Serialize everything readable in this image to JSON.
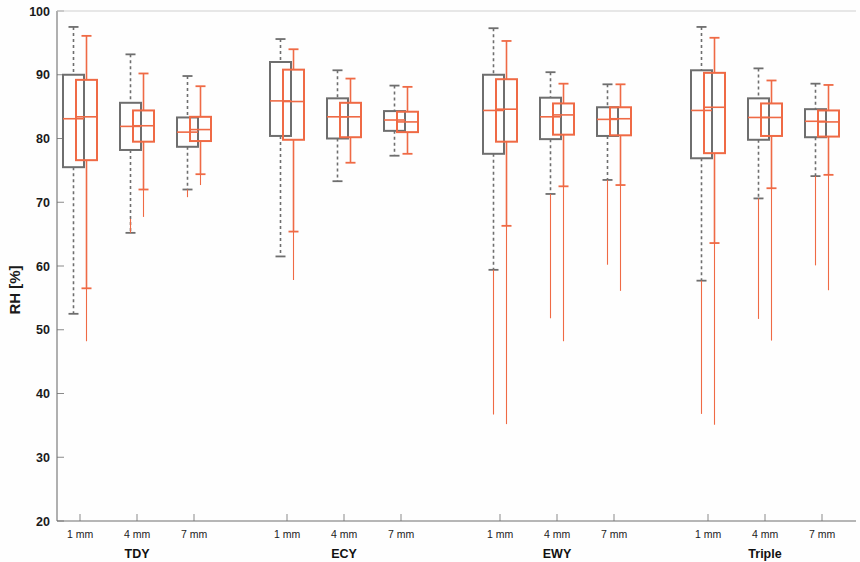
{
  "chart_data": {
    "type": "box",
    "title": "",
    "xlabel": "",
    "ylabel": "RH [%]",
    "ylim": [
      20,
      100
    ],
    "yticks": [
      20,
      30,
      40,
      50,
      60,
      70,
      80,
      90,
      100
    ],
    "ytick_labels": [
      "20",
      "30",
      "40",
      "50",
      "60",
      "70",
      "80",
      "90",
      "100"
    ],
    "grid": false,
    "legend": "none",
    "colors": {
      "series_a": "#6e6e6e",
      "series_b": "#ef6a45",
      "axis": "#6f6f6f",
      "text": "#1a1a1a"
    },
    "groups": [
      "TDY",
      "ECY",
      "EWY",
      "Triple"
    ],
    "subcategories": [
      "1 mm",
      "4 mm",
      "7 mm"
    ],
    "series": [
      {
        "name": "series_a",
        "color": "#6e6e6e",
        "style": "dashed-whisker"
      },
      {
        "name": "series_b",
        "color": "#ef6a45",
        "style": "solid-whisker"
      }
    ],
    "boxes": [
      {
        "group": "TDY",
        "sub": "1 mm",
        "series": "series_a",
        "whisker_high": 97.5,
        "q3": 90.0,
        "median": 83.1,
        "q1": 75.5,
        "whisker_low": 52.5
      },
      {
        "group": "TDY",
        "sub": "1 mm",
        "series": "series_b",
        "whisker_high": 96.1,
        "q3": 89.2,
        "median": 83.4,
        "q1": 76.6,
        "whisker_low": 56.5,
        "tail_low": 48.2
      },
      {
        "group": "TDY",
        "sub": "4 mm",
        "series": "series_a",
        "whisker_high": 93.2,
        "q3": 85.6,
        "median": 81.9,
        "q1": 78.2,
        "whisker_low": 65.2,
        "tail_low": 67.4
      },
      {
        "group": "TDY",
        "sub": "4 mm",
        "series": "series_b",
        "whisker_high": 90.2,
        "q3": 84.4,
        "median": 82.0,
        "q1": 79.5,
        "whisker_low": 72.0,
        "tail_low": 67.7
      },
      {
        "group": "TDY",
        "sub": "7 mm",
        "series": "series_a",
        "whisker_high": 89.8,
        "q3": 83.3,
        "median": 81.0,
        "q1": 78.7,
        "whisker_low": 72.0,
        "tail_low": 70.8
      },
      {
        "group": "TDY",
        "sub": "7 mm",
        "series": "series_b",
        "whisker_high": 88.2,
        "q3": 83.4,
        "median": 81.4,
        "q1": 79.6,
        "whisker_low": 74.4,
        "tail_low": 72.7
      },
      {
        "group": "ECY",
        "sub": "1 mm",
        "series": "series_a",
        "whisker_high": 95.6,
        "q3": 92.0,
        "median": 85.9,
        "q1": 80.4,
        "whisker_low": 61.5
      },
      {
        "group": "ECY",
        "sub": "1 mm",
        "series": "series_b",
        "whisker_high": 94.0,
        "q3": 90.8,
        "median": 85.8,
        "q1": 79.8,
        "whisker_low": 65.4,
        "tail_low": 57.8
      },
      {
        "group": "ECY",
        "sub": "4 mm",
        "series": "series_a",
        "whisker_high": 90.7,
        "q3": 86.3,
        "median": 83.4,
        "q1": 80.0,
        "whisker_low": 73.3
      },
      {
        "group": "ECY",
        "sub": "4 mm",
        "series": "series_b",
        "whisker_high": 89.4,
        "q3": 85.6,
        "median": 83.4,
        "q1": 80.2,
        "whisker_low": 76.2
      },
      {
        "group": "ECY",
        "sub": "7 mm",
        "series": "series_a",
        "whisker_high": 88.3,
        "q3": 84.3,
        "median": 82.9,
        "q1": 81.2,
        "whisker_low": 77.3
      },
      {
        "group": "ECY",
        "sub": "7 mm",
        "series": "series_b",
        "whisker_high": 88.1,
        "q3": 84.2,
        "median": 82.6,
        "q1": 81.0,
        "whisker_low": 77.6
      },
      {
        "group": "EWY",
        "sub": "1 mm",
        "series": "series_a",
        "whisker_high": 97.3,
        "q3": 90.0,
        "median": 84.4,
        "q1": 77.6,
        "whisker_low": 59.4,
        "tail_low": 36.7
      },
      {
        "group": "EWY",
        "sub": "1 mm",
        "series": "series_b",
        "whisker_high": 95.3,
        "q3": 89.3,
        "median": 84.6,
        "q1": 79.5,
        "whisker_low": 66.3,
        "tail_low": 35.2
      },
      {
        "group": "EWY",
        "sub": "4 mm",
        "series": "series_a",
        "whisker_high": 90.4,
        "q3": 86.4,
        "median": 83.4,
        "q1": 79.9,
        "whisker_low": 71.3,
        "tail_low": 51.8
      },
      {
        "group": "EWY",
        "sub": "4 mm",
        "series": "series_b",
        "whisker_high": 88.6,
        "q3": 85.5,
        "median": 83.7,
        "q1": 80.6,
        "whisker_low": 72.5,
        "tail_low": 48.2
      },
      {
        "group": "EWY",
        "sub": "7 mm",
        "series": "series_a",
        "whisker_high": 88.5,
        "q3": 84.9,
        "median": 83.0,
        "q1": 80.4,
        "whisker_low": 73.5,
        "tail_low": 60.2
      },
      {
        "group": "EWY",
        "sub": "7 mm",
        "series": "series_b",
        "whisker_high": 88.5,
        "q3": 84.9,
        "median": 83.1,
        "q1": 80.5,
        "whisker_low": 72.7,
        "tail_low": 56.1
      },
      {
        "group": "Triple",
        "sub": "1 mm",
        "series": "series_a",
        "whisker_high": 97.5,
        "q3": 90.7,
        "median": 84.4,
        "q1": 76.9,
        "whisker_low": 57.7,
        "tail_low": 36.8
      },
      {
        "group": "Triple",
        "sub": "1 mm",
        "series": "series_b",
        "whisker_high": 95.8,
        "q3": 90.3,
        "median": 84.9,
        "q1": 77.7,
        "whisker_low": 63.6,
        "tail_low": 35.1
      },
      {
        "group": "Triple",
        "sub": "4 mm",
        "series": "series_a",
        "whisker_high": 91.0,
        "q3": 86.3,
        "median": 83.3,
        "q1": 79.8,
        "whisker_low": 70.6,
        "tail_low": 51.7
      },
      {
        "group": "Triple",
        "sub": "4 mm",
        "series": "series_b",
        "whisker_high": 89.1,
        "q3": 85.5,
        "median": 83.3,
        "q1": 80.4,
        "whisker_low": 72.2,
        "tail_low": 48.3
      },
      {
        "group": "Triple",
        "sub": "7 mm",
        "series": "series_a",
        "whisker_high": 88.6,
        "q3": 84.6,
        "median": 82.7,
        "q1": 80.2,
        "whisker_low": 74.1,
        "tail_low": 60.1
      },
      {
        "group": "Triple",
        "sub": "7 mm",
        "series": "series_b",
        "whisker_high": 88.4,
        "q3": 84.4,
        "median": 82.6,
        "q1": 80.3,
        "whisker_low": 74.3,
        "tail_low": 56.2
      }
    ]
  },
  "axes": {
    "y_title": "RH [%]",
    "y_tick_labels": [
      "100",
      "90",
      "80",
      "70",
      "60",
      "50",
      "40",
      "30",
      "20"
    ],
    "x_group_labels": [
      "TDY",
      "ECY",
      "EWY",
      "Triple"
    ],
    "x_sub_labels": [
      "1 mm",
      "4 mm",
      "7 mm"
    ]
  }
}
